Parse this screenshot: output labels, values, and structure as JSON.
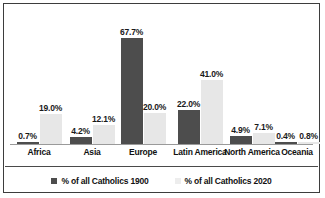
{
  "chart_data": {
    "type": "bar",
    "title": "",
    "subtitle": "",
    "xlabel": "",
    "ylabel": "",
    "grid": false,
    "legend_position": "bottom",
    "ylim": [
      0,
      70
    ],
    "categories": [
      "Africa",
      "Asia",
      "Europe",
      "Latin America",
      "North America",
      "Oceania"
    ],
    "series": [
      {
        "name": "% of all Catholics 1900",
        "color": "#4d4d4d",
        "values": [
          0.7,
          4.2,
          67.7,
          22.0,
          4.9,
          0.4
        ],
        "labels": [
          "0.7%",
          "4.2%",
          "67.7%",
          "22.0%",
          "4.9%",
          "0.4%"
        ]
      },
      {
        "name": "% of all Catholics 2020",
        "color": "#e7e7e7",
        "values": [
          19.0,
          12.1,
          20.0,
          41.0,
          7.1,
          0.8
        ],
        "labels": [
          "19.0%",
          "12.1%",
          "20.0%",
          "41.0%",
          "7.1%",
          "0.8%"
        ]
      }
    ]
  },
  "legend": {
    "items": [
      {
        "label": "% of all Catholics 1900",
        "swatch": "series-1-swatch"
      },
      {
        "label": "% of all Catholics 2020",
        "swatch": "series-2-swatch"
      }
    ]
  },
  "colors": {
    "series_1": "#4d4d4d",
    "series_2": "#e7e7e7",
    "border": "#3d3d3d",
    "axis": "#9a9a9a",
    "text": "#111111",
    "background": "#ffffff"
  }
}
